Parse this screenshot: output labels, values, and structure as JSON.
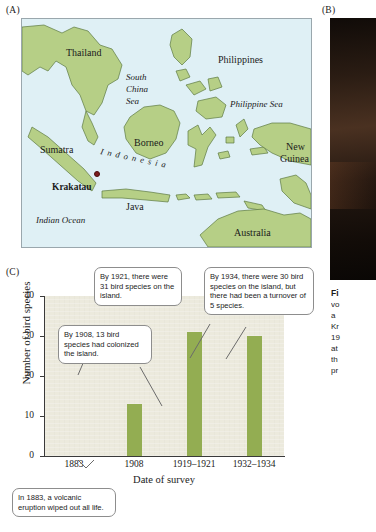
{
  "panels": {
    "a": {
      "letter": "(A)"
    },
    "b": {
      "letter": "(B)"
    },
    "c": {
      "letter": "(C)"
    }
  },
  "map": {
    "labels": [
      {
        "text": "Thailand",
        "kind": "country"
      },
      {
        "text": "Philippines",
        "kind": "country"
      },
      {
        "text": "South",
        "kind": "sea"
      },
      {
        "text": "China",
        "kind": "sea"
      },
      {
        "text": "Sea",
        "kind": "sea"
      },
      {
        "text": "Philippine Sea",
        "kind": "sea"
      },
      {
        "text": "Borneo",
        "kind": "country"
      },
      {
        "text": "Sumatra",
        "kind": "country"
      },
      {
        "text": "New",
        "kind": "country"
      },
      {
        "text": "Guinea",
        "kind": "country"
      },
      {
        "text": "Krakatau",
        "kind": "krakatau"
      },
      {
        "text": "Java",
        "kind": "country"
      },
      {
        "text": "Indian Ocean",
        "kind": "sea"
      },
      {
        "text": "Australia",
        "kind": "country"
      },
      {
        "text": "I n d o n e s i a",
        "kind": "indonesia"
      }
    ],
    "colors": {
      "land": "#b6cf86",
      "water": "#dff0f5",
      "coastline": "#5d7a42",
      "krakatau_marker": "#7b1d1d"
    }
  },
  "caption": {
    "bold_lead": "Fi",
    "lines": [
      "vo",
      "a ",
      "Kr",
      "19",
      "at",
      "th",
      "pr"
    ]
  },
  "chart_data": {
    "type": "bar",
    "title": "",
    "categories": [
      "1883",
      "1908",
      "1919–1921",
      "1932–1934"
    ],
    "values": [
      0,
      13,
      31,
      30
    ],
    "xlabel": "Date of survey",
    "ylabel": "Number of bird species",
    "ylim": [
      0,
      40
    ],
    "yticks": [
      0,
      10,
      20,
      30,
      40
    ],
    "grid": false,
    "legend": null,
    "bar_color": "#93ad52",
    "plot_background": "#eceadd",
    "annotations": [
      {
        "id": "callout-1883",
        "text": "In 1883, a volcanic eruption wiped out all life.",
        "points_to_category": "1883",
        "value": 0
      },
      {
        "id": "callout-1908",
        "text": "By 1908, 13 bird species had colonized the island.",
        "points_to_category": "1908",
        "value": 13
      },
      {
        "id": "callout-1921",
        "text": "By 1921, there were 31 bird species on the island.",
        "points_to_category": "1919–1921",
        "value": 31
      },
      {
        "id": "callout-1934",
        "text": "By 1934, there were 30 bird species on the island, but there had been a turnover of 5 species.",
        "points_to_category": "1932–1934",
        "value": 30
      }
    ]
  }
}
